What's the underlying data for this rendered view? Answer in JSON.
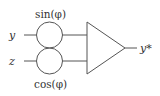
{
  "diagram": {
    "inputs": [
      {
        "label": "y",
        "gate_label": "sin(φ)"
      },
      {
        "label": "z",
        "gate_label": "cos(φ)"
      }
    ],
    "output": {
      "label": "y*"
    },
    "stroke_color": "#555555",
    "text_color": "#333333"
  }
}
